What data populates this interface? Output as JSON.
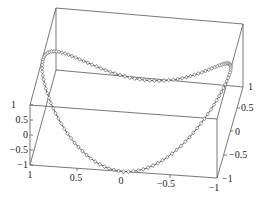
{
  "chart_data": {
    "type": "line",
    "subtype": "3d-parametric-curve-with-markers",
    "title": "",
    "xlabel": "",
    "ylabel": "",
    "zlabel": "",
    "axes": {
      "x": {
        "range": [
          -1,
          1
        ],
        "ticks": [
          1,
          0.5,
          0,
          -0.5,
          -1
        ],
        "tick_labels": [
          "1",
          "0.5",
          "0",
          "−0.5",
          "−1"
        ]
      },
      "y": {
        "range": [
          -1,
          1
        ],
        "ticks": [
          -1,
          -0.5,
          0,
          0.5,
          1
        ],
        "tick_labels": [
          "−1",
          "−0.5",
          "0",
          "0.5",
          "1"
        ]
      },
      "z": {
        "range": [
          -1,
          1
        ],
        "ticks": [
          1,
          0.5,
          0,
          -0.5,
          -1
        ],
        "tick_labels": [
          "1",
          "0.5",
          "0",
          "−0.5",
          "−1"
        ]
      }
    },
    "grid": false,
    "box": true,
    "legend": null,
    "series": [
      {
        "name": "curve",
        "marker": "diamond",
        "points_count": 120,
        "description": "Closed saddle-shaped loop: x=cos t, y=sin t, z=cos 2t (approx.) drawn with diamond markers"
      }
    ]
  },
  "labels": {
    "z_ticks": [
      "1",
      "0.5",
      "0",
      "−0.5",
      "−1"
    ],
    "x_ticks": [
      "1",
      "0.5",
      "0",
      "−0.5",
      "−1"
    ],
    "y_ticks": [
      "−1",
      "−0.5",
      "0",
      "0.5",
      "1"
    ]
  }
}
